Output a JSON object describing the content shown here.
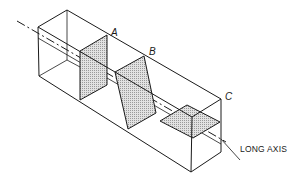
{
  "diagram": {
    "title": "",
    "labels": {
      "plane_a": "A",
      "plane_b": "B",
      "plane_c": "C",
      "long_axis": "LONG AXIS"
    },
    "planes": [
      {
        "id": "A",
        "orientation": "perpendicular to long axis (vertical)"
      },
      {
        "id": "B",
        "orientation": "oblique to long axis"
      },
      {
        "id": "C",
        "orientation": "parallel to long axis (horizontal)"
      }
    ],
    "colors": {
      "line": "#1a1a1a",
      "shading": "#c8c8c8",
      "background": "#ffffff"
    }
  }
}
